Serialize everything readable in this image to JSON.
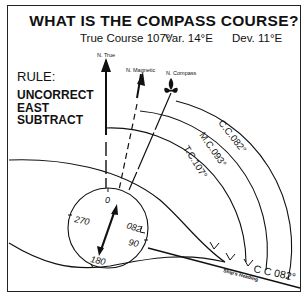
{
  "title": "WHAT IS THE COMPASS COURSE?",
  "given": {
    "true_course": "True Course 107°",
    "variation": "Var. 14°E",
    "deviation": "Dev. 11°E"
  },
  "rule": {
    "heading": "RULE:",
    "lines": [
      "UNCORRECT",
      "EAST",
      "SUBTRACT"
    ]
  },
  "north_labels": {
    "true": "N. True",
    "magnetic": "N. Magnetic",
    "compass": "N. Compass"
  },
  "arcs": {
    "compass_course": "C.C.082°",
    "magnetic_course": "M.C.093°",
    "true_course": "T.C.107°"
  },
  "compass_card": {
    "north": "0",
    "west": "270",
    "south": "180",
    "east": "90",
    "heading": "082"
  },
  "heading_line": {
    "label": "C C 082°",
    "caption": "Ship's Heading"
  }
}
